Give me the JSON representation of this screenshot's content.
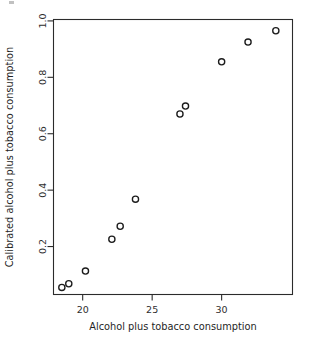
{
  "chart_data": {
    "type": "scatter",
    "title": "",
    "xlabel": "Alcohol plus tobacco consumption",
    "ylabel": "Calibrated alcohol plus tobacco consumption",
    "xlim": [
      17.9,
      35.1
    ],
    "ylim": [
      0.03,
      1.005
    ],
    "grid": false,
    "legend": null,
    "xticks": [
      20,
      25,
      30
    ],
    "xtick_labels": [
      "20",
      "25",
      "30"
    ],
    "yticks": [
      0.2,
      0.4,
      0.6,
      0.8,
      1.0
    ],
    "ytick_labels": [
      "0.2",
      "0.4",
      "0.6",
      "0.8",
      "1.0"
    ],
    "marker": "open-circle",
    "marker_color": "#1c1c1c",
    "n_points": 11,
    "x": [
      18.5,
      19.0,
      20.2,
      22.1,
      22.7,
      23.8,
      27.0,
      27.4,
      30.0,
      31.9,
      33.9
    ],
    "y": [
      0.055,
      0.068,
      0.113,
      0.226,
      0.272,
      0.368,
      0.67,
      0.698,
      0.855,
      0.925,
      0.965
    ],
    "points": [
      {
        "x": 18.5,
        "y": 0.055
      },
      {
        "x": 19.0,
        "y": 0.068
      },
      {
        "x": 20.2,
        "y": 0.113
      },
      {
        "x": 22.1,
        "y": 0.226
      },
      {
        "x": 22.7,
        "y": 0.272
      },
      {
        "x": 23.8,
        "y": 0.368
      },
      {
        "x": 27.0,
        "y": 0.67
      },
      {
        "x": 27.4,
        "y": 0.698
      },
      {
        "x": 30.0,
        "y": 0.855
      },
      {
        "x": 31.9,
        "y": 0.925
      },
      {
        "x": 33.9,
        "y": 0.965
      }
    ]
  }
}
